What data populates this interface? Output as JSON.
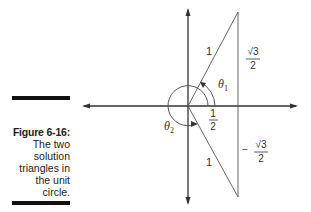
{
  "caption": {
    "label": "Figure 6-16:",
    "text_lines": [
      "The two",
      "solution",
      "triangles in",
      "the unit",
      "circle."
    ]
  },
  "diagram": {
    "labels": {
      "hyp_upper": "1",
      "hyp_lower": "1",
      "theta1": "θ",
      "theta1_sub": "1",
      "theta2": "θ",
      "theta2_sub": "2",
      "x_value_num": "1",
      "x_value_den": "2",
      "y_upper_num": "√3",
      "y_upper_den": "2",
      "y_lower_sign": "−",
      "y_lower_num": "√3",
      "y_lower_den": "2"
    }
  }
}
